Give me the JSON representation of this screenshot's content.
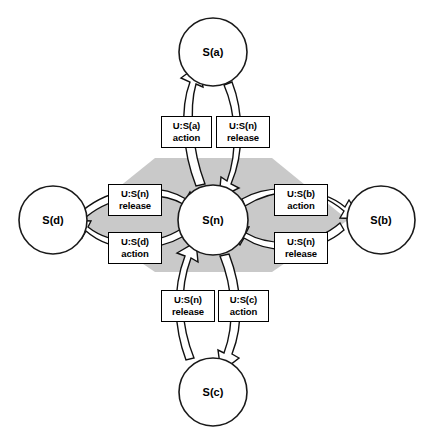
{
  "diagram": {
    "type": "state-transition-diagram",
    "title": "",
    "background_color": "#ffffff",
    "highlight_color": "#c9c9c9",
    "stroke_color": "#111111",
    "node_fill": "#ffffff",
    "nodes": [
      {
        "id": "n",
        "label": "S(n)",
        "role": "center",
        "cx": 213,
        "cy": 220,
        "r": 35
      },
      {
        "id": "a",
        "label": "S(a)",
        "role": "peripheral",
        "position": "top",
        "cx": 213,
        "cy": 52,
        "r": 34
      },
      {
        "id": "b",
        "label": "S(b)",
        "role": "peripheral",
        "position": "right",
        "cx": 381,
        "cy": 220,
        "r": 34
      },
      {
        "id": "c",
        "label": "S(c)",
        "role": "peripheral",
        "position": "bottom",
        "cx": 213,
        "cy": 392,
        "r": 34
      },
      {
        "id": "d",
        "label": "S(d)",
        "role": "peripheral",
        "position": "left",
        "cx": 53,
        "cy": 220,
        "r": 34
      }
    ],
    "transitions": [
      {
        "id": "n-to-a",
        "from": "S(n)",
        "to": "S(a)",
        "event": "U:S(a)",
        "kind": "action",
        "label_line1": "U:S(a)",
        "label_line2": "action",
        "side": "top-left"
      },
      {
        "id": "a-to-n",
        "from": "S(a)",
        "to": "S(n)",
        "event": "U:S(n)",
        "kind": "release",
        "label_line1": "U:S(n)",
        "label_line2": "release",
        "side": "top-right"
      },
      {
        "id": "n-to-b",
        "from": "S(n)",
        "to": "S(b)",
        "event": "U:S(b)",
        "kind": "action",
        "label_line1": "U:S(b)",
        "label_line2": "action",
        "side": "right-top"
      },
      {
        "id": "b-to-n",
        "from": "S(b)",
        "to": "S(n)",
        "event": "U:S(n)",
        "kind": "release",
        "label_line1": "U:S(n)",
        "label_line2": "release",
        "side": "right-bottom"
      },
      {
        "id": "n-to-c",
        "from": "S(n)",
        "to": "S(c)",
        "event": "U:S(c)",
        "kind": "action",
        "label_line1": "U:S(c)",
        "label_line2": "action",
        "side": "bottom-right"
      },
      {
        "id": "c-to-n",
        "from": "S(c)",
        "to": "S(n)",
        "event": "U:S(n)",
        "kind": "release",
        "label_line1": "U:S(n)",
        "label_line2": "release",
        "side": "bottom-left"
      },
      {
        "id": "n-to-d",
        "from": "S(n)",
        "to": "S(d)",
        "event": "U:S(d)",
        "kind": "action",
        "label_line1": "U:S(d)",
        "label_line2": "action",
        "side": "left-bottom"
      },
      {
        "id": "d-to-n",
        "from": "S(d)",
        "to": "S(n)",
        "event": "U:S(n)",
        "kind": "release",
        "label_line1": "U:S(n)",
        "label_line2": "release",
        "side": "left-top"
      }
    ],
    "labels": {
      "top_left": {
        "line1": "U:S(a)",
        "line2": "action"
      },
      "top_right": {
        "line1": "U:S(n)",
        "line2": "release"
      },
      "right_top": {
        "line1": "U:S(b)",
        "line2": "action"
      },
      "right_bottom": {
        "line1": "U:S(n)",
        "line2": "release"
      },
      "bottom_left": {
        "line1": "U:S(n)",
        "line2": "release"
      },
      "bottom_right": {
        "line1": "U:S(c)",
        "line2": "action"
      },
      "left_top": {
        "line1": "U:S(n)",
        "line2": "release"
      },
      "left_bottom": {
        "line1": "U:S(d)",
        "line2": "action"
      }
    },
    "node_labels": {
      "center": "S(n)",
      "top": "S(a)",
      "right": "S(b)",
      "bottom": "S(c)",
      "left": "S(d)"
    }
  }
}
